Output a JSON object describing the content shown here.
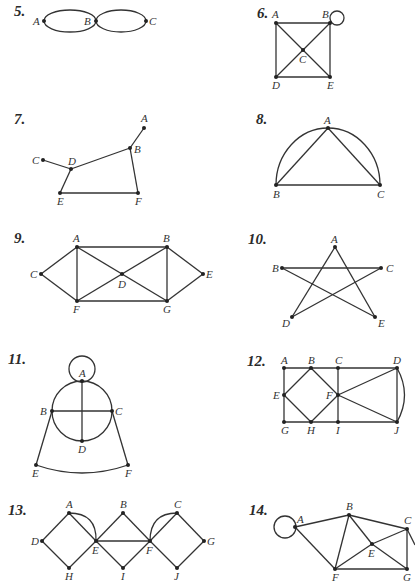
{
  "problems": [
    {
      "number": "5.",
      "vertices": [
        "A",
        "B",
        "C"
      ],
      "edges": [
        [
          "A",
          "B"
        ],
        [
          "A",
          "B"
        ],
        [
          "B",
          "C"
        ],
        [
          "B",
          "C"
        ]
      ]
    },
    {
      "number": "6.",
      "vertices": [
        "A",
        "B",
        "C",
        "D",
        "E"
      ],
      "edges": [
        [
          "A",
          "B"
        ],
        [
          "A",
          "D"
        ],
        [
          "B",
          "E"
        ],
        [
          "D",
          "E"
        ],
        [
          "A",
          "C"
        ],
        [
          "C",
          "E"
        ],
        [
          "B",
          "C"
        ],
        [
          "C",
          "D"
        ],
        [
          "B",
          "B"
        ]
      ]
    },
    {
      "number": "7.",
      "vertices": [
        "A",
        "B",
        "C",
        "D",
        "E",
        "F"
      ],
      "edges": [
        [
          "A",
          "B"
        ],
        [
          "B",
          "D"
        ],
        [
          "C",
          "D"
        ],
        [
          "D",
          "E"
        ],
        [
          "E",
          "F"
        ],
        [
          "B",
          "F"
        ]
      ]
    },
    {
      "number": "8.",
      "vertices": [
        "A",
        "B",
        "C"
      ],
      "edges": [
        [
          "A",
          "B"
        ],
        [
          "A",
          "C"
        ],
        [
          "B",
          "C"
        ],
        [
          "B",
          "A"
        ],
        [
          "A",
          "C"
        ]
      ]
    },
    {
      "number": "9.",
      "vertices": [
        "A",
        "B",
        "C",
        "D",
        "E",
        "F",
        "G"
      ],
      "edges": [
        [
          "A",
          "B"
        ],
        [
          "A",
          "C"
        ],
        [
          "A",
          "F"
        ],
        [
          "A",
          "D"
        ],
        [
          "C",
          "F"
        ],
        [
          "F",
          "D"
        ],
        [
          "F",
          "G"
        ],
        [
          "D",
          "B"
        ],
        [
          "D",
          "G"
        ],
        [
          "B",
          "G"
        ],
        [
          "B",
          "E"
        ],
        [
          "E",
          "G"
        ]
      ]
    },
    {
      "number": "10.",
      "vertices": [
        "A",
        "B",
        "C",
        "D",
        "E"
      ],
      "edges": [
        [
          "A",
          "D"
        ],
        [
          "A",
          "E"
        ],
        [
          "B",
          "C"
        ],
        [
          "B",
          "E"
        ],
        [
          "C",
          "D"
        ]
      ]
    },
    {
      "number": "11.",
      "vertices": [
        "A",
        "B",
        "C",
        "D",
        "E",
        "F"
      ],
      "edges": [
        [
          "A",
          "A"
        ],
        [
          "A",
          "B"
        ],
        [
          "A",
          "C"
        ],
        [
          "B",
          "D"
        ],
        [
          "C",
          "D"
        ],
        [
          "A",
          "D"
        ],
        [
          "B",
          "C"
        ],
        [
          "B",
          "E"
        ],
        [
          "C",
          "F"
        ],
        [
          "E",
          "F"
        ]
      ]
    },
    {
      "number": "12.",
      "vertices": [
        "A",
        "B",
        "C",
        "D",
        "E",
        "F",
        "G",
        "H",
        "I",
        "J"
      ],
      "edges": [
        [
          "A",
          "B"
        ],
        [
          "B",
          "C"
        ],
        [
          "C",
          "D"
        ],
        [
          "A",
          "E"
        ],
        [
          "E",
          "G"
        ],
        [
          "G",
          "H"
        ],
        [
          "H",
          "I"
        ],
        [
          "I",
          "J"
        ],
        [
          "B",
          "E"
        ],
        [
          "E",
          "H"
        ],
        [
          "B",
          "F"
        ],
        [
          "F",
          "H"
        ],
        [
          "C",
          "F"
        ],
        [
          "F",
          "I"
        ],
        [
          "F",
          "D"
        ],
        [
          "F",
          "J"
        ],
        [
          "D",
          "J"
        ],
        [
          "D",
          "J"
        ]
      ]
    },
    {
      "number": "13.",
      "vertices": [
        "A",
        "B",
        "C",
        "D",
        "E",
        "F",
        "G",
        "H",
        "I",
        "J"
      ],
      "edges": [
        [
          "A",
          "D"
        ],
        [
          "D",
          "H"
        ],
        [
          "H",
          "E"
        ],
        [
          "A",
          "E"
        ],
        [
          "A",
          "E"
        ],
        [
          "E",
          "B"
        ],
        [
          "B",
          "F"
        ],
        [
          "E",
          "I"
        ],
        [
          "I",
          "F"
        ],
        [
          "E",
          "F"
        ],
        [
          "F",
          "C"
        ],
        [
          "F",
          "C"
        ],
        [
          "C",
          "G"
        ],
        [
          "F",
          "J"
        ],
        [
          "J",
          "G"
        ]
      ]
    },
    {
      "number": "14.",
      "vertices": [
        "A",
        "B",
        "C",
        "E",
        "F",
        "G"
      ],
      "edges": [
        [
          "A",
          "A"
        ],
        [
          "A",
          "B"
        ],
        [
          "A",
          "F"
        ],
        [
          "B",
          "F"
        ],
        [
          "B",
          "E"
        ],
        [
          "B",
          "C"
        ],
        [
          "E",
          "C"
        ],
        [
          "E",
          "F"
        ],
        [
          "E",
          "G"
        ],
        [
          "F",
          "G"
        ],
        [
          "C",
          "G"
        ]
      ]
    }
  ],
  "labels": {
    "p5": {
      "num": "5.",
      "A": "A",
      "B": "B",
      "C": "C"
    },
    "p6": {
      "num": "6.",
      "A": "A",
      "B": "B",
      "C": "C",
      "D": "D",
      "E": "E"
    },
    "p7": {
      "num": "7.",
      "A": "A",
      "B": "B",
      "C": "C",
      "D": "D",
      "E": "E",
      "F": "F"
    },
    "p8": {
      "num": "8.",
      "A": "A",
      "B": "B",
      "C": "C"
    },
    "p9": {
      "num": "9.",
      "A": "A",
      "B": "B",
      "C": "C",
      "D": "D",
      "E": "E",
      "F": "F",
      "G": "G"
    },
    "p10": {
      "num": "10.",
      "A": "A",
      "B": "B",
      "C": "C",
      "D": "D",
      "E": "E"
    },
    "p11": {
      "num": "11.",
      "A": "A",
      "B": "B",
      "C": "C",
      "D": "D",
      "E": "E",
      "F": "F"
    },
    "p12": {
      "num": "12.",
      "A": "A",
      "B": "B",
      "C": "C",
      "D": "D",
      "E": "E",
      "F": "F",
      "G": "G",
      "H": "H",
      "I": "I",
      "J": "J"
    },
    "p13": {
      "num": "13.",
      "A": "A",
      "B": "B",
      "C": "C",
      "D": "D",
      "E": "E",
      "F": "F",
      "G": "G",
      "H": "H",
      "I": "I",
      "J": "J"
    },
    "p14": {
      "num": "14.",
      "A": "A",
      "B": "B",
      "C": "C",
      "E": "E",
      "F": "F",
      "G": "G"
    }
  }
}
